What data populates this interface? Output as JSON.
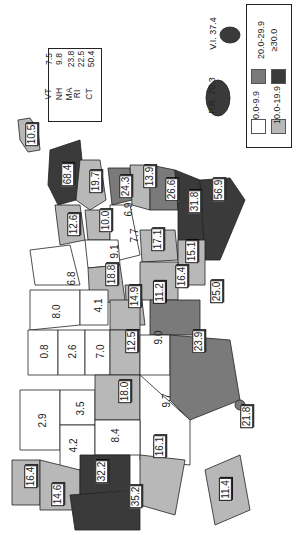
{
  "legend": {
    "items": [
      {
        "range": "0.0-9.9",
        "color": "#ffffff"
      },
      {
        "range": "10.0-19.9",
        "color": "#b8b8b8"
      },
      {
        "range": "20.0-29.9",
        "color": "#7a7a7a"
      },
      {
        "range": "≥30.0",
        "color": "#3a3a3a"
      }
    ]
  },
  "northeast_box": [
    {
      "state": "VT",
      "value": "7.5"
    },
    {
      "state": "NH",
      "value": "9.8"
    },
    {
      "state": "MA",
      "value": "23.8"
    },
    {
      "state": "RI",
      "value": "22.5"
    },
    {
      "state": "CT",
      "value": "50.4"
    },
    {
      "state": "NJ",
      "value": "55.5"
    },
    {
      "state": "DE",
      "value": "44.1"
    },
    {
      "state": "MD",
      "value": "51.1"
    },
    {
      "state": "D.C.",
      "value": "185.7"
    }
  ],
  "territories": {
    "pr": "P.R. 70.3",
    "vi": "V.I. 37.4"
  },
  "states": [
    {
      "state": "ME",
      "value": "10.5",
      "boxed": true
    },
    {
      "state": "NY",
      "value": "68.4",
      "boxed": true
    },
    {
      "state": "PA",
      "value": "19.7",
      "boxed": true
    },
    {
      "state": "OH",
      "value": "24.3",
      "boxed": true
    },
    {
      "state": "WV",
      "value": "13.9",
      "boxed": true
    },
    {
      "state": "VA",
      "value": "26.6",
      "boxed": true
    },
    {
      "state": "NC",
      "value": "31.8",
      "boxed": true
    },
    {
      "state": "FL",
      "value": "56.9",
      "boxed": true
    },
    {
      "state": "MI",
      "value": "12.6",
      "boxed": true
    },
    {
      "state": "IN",
      "value": "10.0",
      "boxed": true
    },
    {
      "state": "KY",
      "value": "6.9",
      "boxed": false
    },
    {
      "state": "WI",
      "value": "6.8",
      "boxed": false
    },
    {
      "state": "IL",
      "value": "9.1",
      "boxed": false
    },
    {
      "state": "TN",
      "value": "7.7",
      "boxed": false
    },
    {
      "state": "SC",
      "value": "17.1",
      "boxed": true
    },
    {
      "state": "GA",
      "value": "15.1",
      "boxed": true
    },
    {
      "state": "MN",
      "value": "8.0",
      "boxed": false
    },
    {
      "state": "IA",
      "value": "4.1",
      "boxed": false
    },
    {
      "state": "MO",
      "value": "18.8",
      "boxed": true
    },
    {
      "state": "AR",
      "value": "14.9",
      "boxed": true
    },
    {
      "state": "MS",
      "value": "11.2",
      "boxed": true
    },
    {
      "state": "AL",
      "value": "16.4",
      "boxed": true
    },
    {
      "state": "LA",
      "value": "25.0",
      "boxed": true
    },
    {
      "state": "ND",
      "value": "0.8",
      "boxed": false
    },
    {
      "state": "SD",
      "value": "2.6",
      "boxed": false
    },
    {
      "state": "NE",
      "value": "7.0",
      "boxed": false
    },
    {
      "state": "KS",
      "value": "12.5",
      "boxed": true
    },
    {
      "state": "OK",
      "value": "9.0",
      "boxed": false
    },
    {
      "state": "TX",
      "value": "23.9",
      "boxed": true
    },
    {
      "state": "MT",
      "value": "2.9",
      "boxed": false
    },
    {
      "state": "WY",
      "value": "3.5",
      "boxed": false
    },
    {
      "state": "CO",
      "value": "18.0",
      "boxed": true
    },
    {
      "state": "NM",
      "value": "9.7",
      "boxed": false
    },
    {
      "state": "ID",
      "value": "4.2",
      "boxed": false
    },
    {
      "state": "UT",
      "value": "8.4",
      "boxed": false
    },
    {
      "state": "AZ",
      "value": "16.1",
      "boxed": true
    },
    {
      "state": "WA",
      "value": "16.4",
      "boxed": true
    },
    {
      "state": "OR",
      "value": "14.6",
      "boxed": true
    },
    {
      "state": "NV",
      "value": "32.2",
      "boxed": true
    },
    {
      "state": "CA",
      "value": "35.2",
      "boxed": true
    },
    {
      "state": "HI",
      "value": "21.8",
      "boxed": true
    },
    {
      "state": "AK",
      "value": "11.4",
      "boxed": true
    }
  ]
}
